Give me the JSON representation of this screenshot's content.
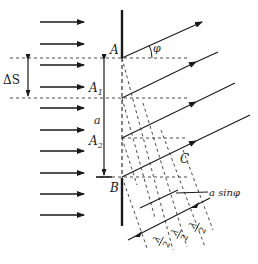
{
  "diagram": {
    "labels": {
      "A": "A",
      "B": "B",
      "C": "C",
      "A1": "A",
      "A1_sub": "1",
      "A2": "A",
      "A2_sub": "2",
      "a": "a",
      "delta_s": "ΔS",
      "phi": "φ",
      "a_sin_phi": "a sinφ",
      "lambda": "λ",
      "two": "2"
    },
    "incident_arrows_count": 10,
    "diffracted_rays_count": 4,
    "half_wave_zones": 3,
    "colors": {
      "line": "#1a1a1a",
      "dash": "#333333",
      "background": "#ffffff"
    }
  }
}
